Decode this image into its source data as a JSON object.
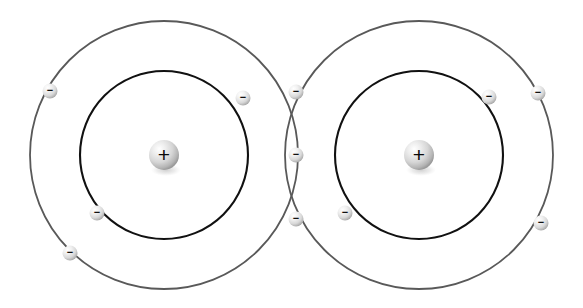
{
  "diagram": {
    "background_color": "#ffffff",
    "canvas": {
      "width": 583,
      "height": 308
    },
    "colors": {
      "inner_shell_stroke": "#111111",
      "outer_shell_stroke": "#595959",
      "nucleus_fill_light": "#ffffff",
      "nucleus_fill_mid": "#d2d2d2",
      "nucleus_fill_dark": "#9a9a9a",
      "electron_fill_light": "#ffffff",
      "electron_fill_mid": "#dcdcdc",
      "electron_fill_dark": "#a8a8a8",
      "sign_color": "#111111"
    },
    "atoms": [
      {
        "id": "atom-left",
        "name": "left-atom",
        "nucleus": {
          "name": "left-nucleus",
          "cx": 164,
          "cy": 155,
          "r": 15,
          "charge_symbol": "+"
        },
        "shells": [
          {
            "name": "left-inner-shell",
            "cx": 164,
            "cy": 155,
            "r": 84,
            "stroke": "#111111",
            "stroke_width": 2.1
          },
          {
            "name": "left-outer-shell",
            "cx": 164,
            "cy": 155,
            "r": 134,
            "stroke": "#595959",
            "stroke_width": 1.8
          }
        ]
      },
      {
        "id": "atom-right",
        "name": "right-atom",
        "nucleus": {
          "name": "right-nucleus",
          "cx": 419,
          "cy": 155,
          "r": 15,
          "charge_symbol": "+"
        },
        "shells": [
          {
            "name": "right-inner-shell",
            "cx": 419,
            "cy": 155,
            "r": 84,
            "stroke": "#111111",
            "stroke_width": 2.1
          },
          {
            "name": "right-outer-shell",
            "cx": 419,
            "cy": 155,
            "r": 134,
            "stroke": "#595959",
            "stroke_width": 1.8
          }
        ]
      }
    ],
    "electrons": [
      {
        "id": "e-l-inner-1",
        "name": "electron-left-inner-upper-right",
        "cx": 243,
        "cy": 98,
        "r": 7.5,
        "shell": "left-inner-shell",
        "charge_symbol": "−"
      },
      {
        "id": "e-l-inner-2",
        "name": "electron-left-inner-lower-left",
        "cx": 97,
        "cy": 213,
        "r": 7.5,
        "shell": "left-inner-shell",
        "charge_symbol": "−"
      },
      {
        "id": "e-l-outer-1",
        "name": "electron-left-outer-upper-left",
        "cx": 50,
        "cy": 91,
        "r": 7.5,
        "shell": "left-outer-shell",
        "charge_symbol": "−"
      },
      {
        "id": "e-l-outer-2",
        "name": "electron-left-outer-lower-left",
        "cx": 70,
        "cy": 253,
        "r": 7.5,
        "shell": "left-outer-shell",
        "charge_symbol": "−"
      },
      {
        "id": "e-r-inner-1",
        "name": "electron-right-inner-upper-right",
        "cx": 489,
        "cy": 97,
        "r": 7.5,
        "shell": "right-inner-shell",
        "charge_symbol": "−"
      },
      {
        "id": "e-r-inner-2",
        "name": "electron-right-inner-lower-left",
        "cx": 345,
        "cy": 213,
        "r": 7.5,
        "shell": "right-inner-shell",
        "charge_symbol": "−"
      },
      {
        "id": "e-r-outer-1",
        "name": "electron-right-outer-upper-right",
        "cx": 538,
        "cy": 93,
        "r": 7.5,
        "shell": "right-outer-shell",
        "charge_symbol": "−"
      },
      {
        "id": "e-r-outer-2",
        "name": "electron-right-outer-lower-right",
        "cx": 541,
        "cy": 223,
        "r": 7.5,
        "shell": "right-outer-shell",
        "charge_symbol": "−"
      },
      {
        "id": "e-shared-top",
        "name": "electron-shared-top-intersection",
        "cx": 296,
        "cy": 92,
        "r": 7.5,
        "shell": "shell-intersection",
        "charge_symbol": "−"
      },
      {
        "id": "e-shared-mid",
        "name": "electron-shared-center",
        "cx": 296,
        "cy": 155,
        "r": 7.5,
        "shell": "overlap-lens",
        "charge_symbol": "−"
      },
      {
        "id": "e-shared-bottom",
        "name": "electron-shared-bottom-intersection",
        "cx": 296,
        "cy": 219,
        "r": 7.5,
        "shell": "shell-intersection",
        "charge_symbol": "−"
      }
    ]
  }
}
